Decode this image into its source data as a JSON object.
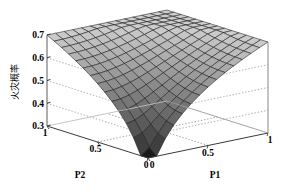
{
  "figure": {
    "title": "",
    "background_color": "#ffffff",
    "line_color": "#1a1a1a",
    "axis_color": "#555555",
    "grid_style": "dotted"
  },
  "axes": {
    "z": {
      "label": "火灾概率",
      "ticks": [
        "0.3",
        "0.4",
        "0.5",
        "0.6",
        "0.7"
      ],
      "values": [
        0.3,
        0.4,
        0.5,
        0.6,
        0.7
      ],
      "min": 0.3,
      "max": 0.7
    },
    "x": {
      "label": "P1",
      "ticks": [
        "0",
        "0.5",
        "1"
      ],
      "values": [
        0,
        0.5,
        1
      ],
      "min": 0,
      "max": 1
    },
    "y": {
      "label": "P2",
      "ticks": [
        "1",
        "0.5",
        "0"
      ],
      "values": [
        1,
        0.5,
        0
      ],
      "min": 0,
      "max": 1
    }
  },
  "chart_data": {
    "type": "surface",
    "title": "",
    "xlabel": "P1",
    "ylabel": "P2",
    "zlabel": "火灾概率",
    "xlim": [
      0,
      1
    ],
    "ylim": [
      0,
      1
    ],
    "zlim": [
      0.3,
      0.7
    ],
    "grid": true,
    "legend": "none",
    "colormap": "gray",
    "x": [
      0,
      0.1,
      0.2,
      0.3,
      0.4,
      0.5,
      0.6,
      0.7,
      0.8,
      0.9,
      1.0
    ],
    "y": [
      0,
      0.1,
      0.2,
      0.3,
      0.4,
      0.5,
      0.6,
      0.7,
      0.8,
      0.9,
      1.0
    ],
    "z": [
      [
        0.3,
        0.452,
        0.531,
        0.578,
        0.61,
        0.632,
        0.649,
        0.662,
        0.672,
        0.681,
        0.688
      ],
      [
        0.452,
        0.52,
        0.566,
        0.599,
        0.622,
        0.64,
        0.654,
        0.665,
        0.674,
        0.682,
        0.689
      ],
      [
        0.531,
        0.566,
        0.597,
        0.62,
        0.638,
        0.652,
        0.663,
        0.672,
        0.68,
        0.686,
        0.691
      ],
      [
        0.578,
        0.599,
        0.62,
        0.638,
        0.652,
        0.663,
        0.672,
        0.679,
        0.685,
        0.69,
        0.694
      ],
      [
        0.61,
        0.622,
        0.638,
        0.652,
        0.663,
        0.672,
        0.679,
        0.685,
        0.69,
        0.694,
        0.697
      ],
      [
        0.632,
        0.64,
        0.652,
        0.663,
        0.672,
        0.679,
        0.685,
        0.69,
        0.694,
        0.697,
        0.699
      ],
      [
        0.649,
        0.654,
        0.663,
        0.672,
        0.679,
        0.685,
        0.69,
        0.694,
        0.697,
        0.699,
        0.7
      ],
      [
        0.662,
        0.665,
        0.672,
        0.679,
        0.685,
        0.69,
        0.694,
        0.697,
        0.699,
        0.7,
        0.7
      ],
      [
        0.672,
        0.674,
        0.68,
        0.685,
        0.69,
        0.694,
        0.697,
        0.699,
        0.7,
        0.7,
        0.7
      ],
      [
        0.681,
        0.682,
        0.686,
        0.69,
        0.694,
        0.697,
        0.699,
        0.7,
        0.7,
        0.7,
        0.7
      ],
      [
        0.688,
        0.689,
        0.691,
        0.694,
        0.697,
        0.699,
        0.7,
        0.7,
        0.7,
        0.7,
        0.7
      ]
    ],
    "annotations": [
      "Funnel-shaped valley with minimum at P1=0, P2=0",
      "Surface rises to plateau near 0.70 at large P1 and P2"
    ]
  },
  "view": {
    "azimuth_deg": -37.5,
    "elevation_deg": 30
  }
}
